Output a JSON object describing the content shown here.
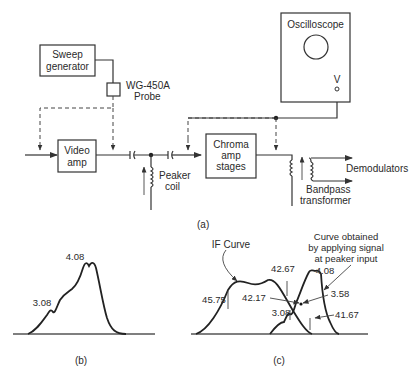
{
  "figure_a": {
    "caption": "(a)",
    "blocks": {
      "sweep_generator": {
        "line1": "Sweep",
        "line2": "generator"
      },
      "probe": {
        "line1": "WG-450A",
        "line2": "Probe"
      },
      "video_amp": {
        "line1": "Video",
        "line2": "amp"
      },
      "chroma_amp": {
        "line1": "Chroma",
        "line2": "amp",
        "line3": "stages"
      },
      "oscilloscope": {
        "title": "Oscilloscope",
        "input": "V"
      },
      "peaker_coil": {
        "line1": "Peaker",
        "line2": "coil"
      },
      "bandpass_transformer": {
        "line1": "Bandpass",
        "line2": "transformer"
      },
      "demodulators": "Demodulators"
    }
  },
  "figure_b": {
    "caption": "(b)",
    "markers": {
      "low": "3.08",
      "peak": "4.08"
    }
  },
  "figure_c": {
    "caption": "(c)",
    "if_curve_label": "IF Curve",
    "peaker_curve_label": {
      "line1": "Curve obtained",
      "line2": "by applying signal",
      "line3": "at peaker input"
    },
    "markers": {
      "m45_75": "45.75",
      "m42_67": "42.67",
      "m42_17": "42.17",
      "m41_67": "41.67",
      "m4_08": "4.08",
      "m3_58": "3.58",
      "m3_08": "3.08"
    }
  }
}
